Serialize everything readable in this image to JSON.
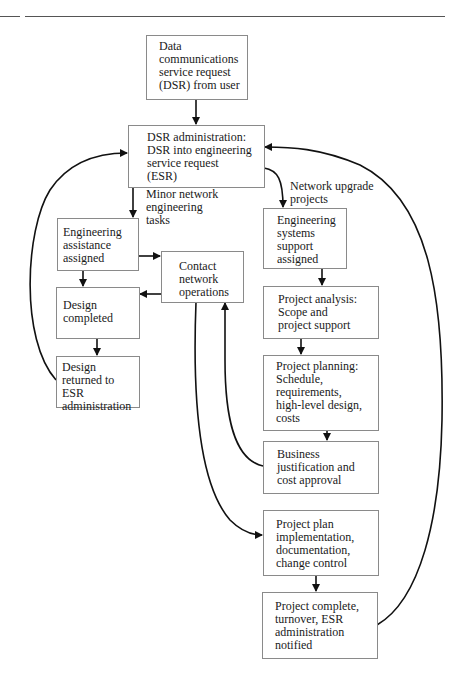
{
  "diagram": {
    "type": "flowchart",
    "nodes": [
      {
        "id": "dsr_request",
        "text": "Data\ncommunications\nservice request\n(DSR) from user"
      },
      {
        "id": "dsr_admin",
        "text": "DSR administration:\nDSR into engineering\nservice request\n(ESR)"
      },
      {
        "id": "eng_assistance",
        "text": "Engineering\nassistance\nassigned"
      },
      {
        "id": "contact_netops",
        "text": "Contact\nnetwork\noperations"
      },
      {
        "id": "design_completed",
        "text": "Design\ncompleted"
      },
      {
        "id": "design_returned",
        "text": "Design\nreturned to ESR\nadministration"
      },
      {
        "id": "eng_systems",
        "text": "Engineering\nsystems\nsupport\nassigned"
      },
      {
        "id": "project_analysis",
        "text": "Project analysis:\nScope and\nproject support"
      },
      {
        "id": "project_planning",
        "text": "Project planning:\nSchedule,\nrequirements,\nhigh-level design,\ncosts"
      },
      {
        "id": "business_justification",
        "text": "Business\njustification and\ncost approval"
      },
      {
        "id": "plan_implementation",
        "text": "Project plan\nimplementation,\ndocumentation,\nchange control"
      },
      {
        "id": "project_complete",
        "text": "Project complete,\nturnover, ESR\nadministration\nnotified"
      }
    ],
    "edge_labels": {
      "minor": "Minor network\nengineering\ntasks",
      "upgrade": "Network upgrade\nprojects"
    },
    "edges": [
      {
        "from": "dsr_request",
        "to": "dsr_admin"
      },
      {
        "from": "dsr_admin",
        "to": "eng_assistance",
        "label": "Minor network engineering tasks"
      },
      {
        "from": "dsr_admin",
        "to": "eng_systems",
        "label": "Network upgrade projects"
      },
      {
        "from": "eng_assistance",
        "to": "contact_netops"
      },
      {
        "from": "eng_assistance",
        "to": "design_completed"
      },
      {
        "from": "contact_netops",
        "to": "design_completed"
      },
      {
        "from": "design_completed",
        "to": "design_returned"
      },
      {
        "from": "design_returned",
        "to": "dsr_admin"
      },
      {
        "from": "eng_systems",
        "to": "project_analysis"
      },
      {
        "from": "project_analysis",
        "to": "project_planning"
      },
      {
        "from": "project_planning",
        "to": "business_justification"
      },
      {
        "from": "business_justification",
        "to": "contact_netops"
      },
      {
        "from": "contact_netops",
        "to": "plan_implementation"
      },
      {
        "from": "plan_implementation",
        "to": "project_complete"
      },
      {
        "from": "project_complete",
        "to": "dsr_admin"
      }
    ],
    "colors": {
      "line": "#111111",
      "border": "#8a8a8a",
      "background": "#ffffff"
    }
  }
}
